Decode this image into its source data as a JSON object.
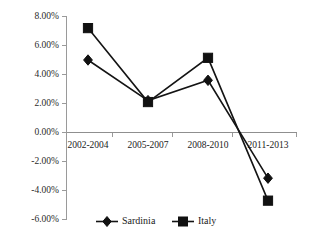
{
  "chart_data": {
    "type": "line",
    "title": "",
    "subtitle": "",
    "xlabel": "",
    "ylabel": "",
    "categories": [
      "2002-2004",
      "2005-2007",
      "2008-2010",
      "2011-2013"
    ],
    "series": [
      {
        "name": "Sardinia",
        "marker": "diamond",
        "color": "#111111",
        "values": [
          5.0,
          2.2,
          3.6,
          -3.15
        ]
      },
      {
        "name": "Italy",
        "marker": "square",
        "color": "#111111",
        "values": [
          7.2,
          2.1,
          5.15,
          -4.7
        ]
      }
    ],
    "ylim": [
      -6.0,
      8.0
    ],
    "ytick_values": [
      8.0,
      6.0,
      4.0,
      2.0,
      0.0,
      -2.0,
      -4.0,
      -6.0
    ],
    "ytick_labels": [
      "8.00%",
      "6.00%",
      "4.00%",
      "2.00%",
      "0.00%",
      "-2.00%",
      "-4.00%",
      "-6.00%"
    ],
    "grid": false,
    "legend_position": "bottom",
    "legend_entries": [
      "Sardinia",
      "Italy"
    ],
    "value_unit": "percent"
  },
  "legend": {
    "items": [
      {
        "label": "Sardinia"
      },
      {
        "label": "Italy"
      }
    ]
  },
  "axes": {
    "y": {
      "labels": [
        "8.00%",
        "6.00%",
        "4.00%",
        "2.00%",
        "0.00%",
        "-2.00%",
        "-4.00%",
        "-6.00%"
      ]
    },
    "x": {
      "labels": [
        "2002-2004",
        "2005-2007",
        "2008-2010",
        "2011-2013"
      ]
    }
  },
  "colors": {
    "series_line": "#111111",
    "axis": "#9a9a9a",
    "background": "#ffffff",
    "text": "#1a1a1a"
  }
}
